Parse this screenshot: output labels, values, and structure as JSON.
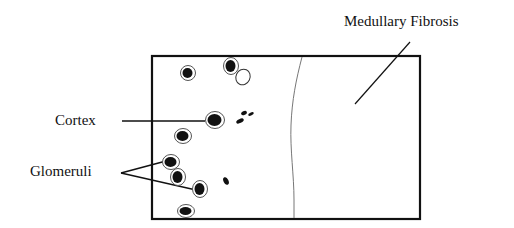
{
  "diagram": {
    "labels": {
      "medullary_fibrosis": "Medullary Fibrosis",
      "cortex": "Cortex",
      "glomeruli": "Glomeruli"
    },
    "colors": {
      "ink": "#111111",
      "ring": "#555555",
      "boundary_line": "#777777",
      "background": "#ffffff"
    },
    "regions": [
      {
        "name": "cortex",
        "side": "left"
      },
      {
        "name": "medulla",
        "side": "right",
        "annotation": "Medullary Fibrosis"
      }
    ],
    "glomeruli": [
      {
        "x": 188,
        "y": 73,
        "rx": 5,
        "ry": 5
      },
      {
        "x": 231,
        "y": 66,
        "rx": 5,
        "ry": 6
      },
      {
        "x": 215,
        "y": 120,
        "rx": 7,
        "ry": 6
      },
      {
        "x": 183,
        "y": 136,
        "rx": 6,
        "ry": 5
      },
      {
        "x": 171,
        "y": 162,
        "rx": 6,
        "ry": 5
      },
      {
        "x": 178,
        "y": 177,
        "rx": 5,
        "ry": 6
      },
      {
        "x": 200,
        "y": 189,
        "rx": 5,
        "ry": 6
      },
      {
        "x": 186,
        "y": 211,
        "rx": 6,
        "ry": 4
      }
    ],
    "empty_glomerulus": {
      "x": 243,
      "y": 77,
      "rx": 7,
      "ry": 8
    },
    "small_bodies": [
      {
        "x": 244,
        "y": 113,
        "rx": 3,
        "ry": 2
      },
      {
        "x": 251,
        "y": 114,
        "rx": 3,
        "ry": 1.5
      },
      {
        "x": 240,
        "y": 121,
        "rx": 4,
        "ry": 2
      },
      {
        "x": 226,
        "y": 181,
        "rx": 2.5,
        "ry": 4
      }
    ]
  }
}
